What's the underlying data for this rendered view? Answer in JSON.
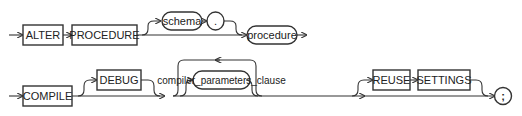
{
  "diagram": {
    "type": "railroad-syntax-diagram",
    "row1": {
      "keywords": [
        "ALTER",
        "PROCEDURE"
      ],
      "optional_prefix": {
        "schema": "schema",
        "dot": "."
      },
      "identifier": "procedure"
    },
    "row2": {
      "keyword_compile": "COMPILE",
      "optional_debug": "DEBUG",
      "repeatable_clause": "compiler_parameters_clause",
      "optional_reuse": [
        "REUSE",
        "SETTINGS"
      ],
      "terminator": ";"
    }
  }
}
